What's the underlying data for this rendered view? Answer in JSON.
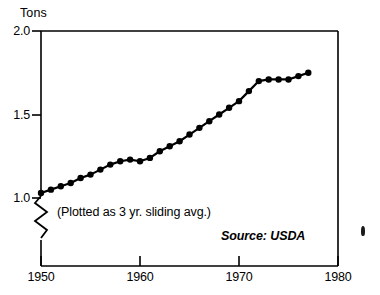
{
  "chart_data": {
    "type": "line",
    "title": "",
    "subtitle": "",
    "xlabel": "",
    "ylabel": "Tons",
    "unit_label": "Tons",
    "xlim": [
      1950,
      1980
    ],
    "ylim": [
      1.0,
      2.0
    ],
    "y_axis_break": true,
    "grid": false,
    "legend": false,
    "legend_position": "none",
    "marker": "filled-circle",
    "line_color": "#000000",
    "marker_color": "#000000",
    "background_color": "#ffffff",
    "xticks": [
      1950,
      1960,
      1970,
      1980
    ],
    "xtick_labels": [
      "1950",
      "1960",
      "1970",
      "1980"
    ],
    "yticks": [
      1.0,
      1.5,
      2.0
    ],
    "ytick_labels": [
      "1.0",
      "1.5",
      "2.0"
    ],
    "annotations": [
      "(Plotted as 3 yr. sliding avg.)",
      "Source: USDA"
    ],
    "note": "(Plotted as 3 yr. sliding avg.)",
    "source": "Source: USDA",
    "x": [
      1950,
      1951,
      1952,
      1953,
      1954,
      1955,
      1956,
      1957,
      1958,
      1959,
      1960,
      1961,
      1962,
      1963,
      1964,
      1965,
      1966,
      1967,
      1968,
      1969,
      1970,
      1971,
      1972,
      1973,
      1974,
      1975,
      1976,
      1977
    ],
    "values": [
      1.03,
      1.05,
      1.07,
      1.09,
      1.12,
      1.14,
      1.17,
      1.2,
      1.22,
      1.23,
      1.22,
      1.24,
      1.28,
      1.31,
      1.34,
      1.38,
      1.42,
      1.46,
      1.5,
      1.54,
      1.58,
      1.64,
      1.7,
      1.71,
      1.71,
      1.71,
      1.73,
      1.75
    ],
    "series": [
      {
        "name": "Tons",
        "values": [
          1.03,
          1.05,
          1.07,
          1.09,
          1.12,
          1.14,
          1.17,
          1.2,
          1.22,
          1.23,
          1.22,
          1.24,
          1.28,
          1.31,
          1.34,
          1.38,
          1.42,
          1.46,
          1.5,
          1.54,
          1.58,
          1.64,
          1.7,
          1.71,
          1.71,
          1.71,
          1.73,
          1.75
        ]
      }
    ]
  }
}
